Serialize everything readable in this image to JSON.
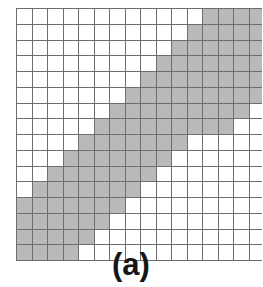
{
  "figure": {
    "caption": "(a)",
    "kind": "binary-grid-diagram"
  },
  "colors": {
    "filled_cell": "#b9b9b9",
    "empty_cell": "#ffffff",
    "grid_line": "#6e6e6e",
    "caption_text": "#161616",
    "background": "#ffffff"
  },
  "chart_data": {
    "type": "heatmap",
    "title": "(a)",
    "xlabel": "",
    "ylabel": "",
    "rows": 16,
    "cols": 16,
    "value_legend": {
      "0": "empty",
      "1": "shaded"
    },
    "cells": [
      [
        0,
        0,
        0,
        0,
        0,
        0,
        0,
        0,
        0,
        0,
        0,
        0,
        1,
        1,
        1,
        1
      ],
      [
        0,
        0,
        0,
        0,
        0,
        0,
        0,
        0,
        0,
        0,
        0,
        1,
        1,
        1,
        1,
        1
      ],
      [
        0,
        0,
        0,
        0,
        0,
        0,
        0,
        0,
        0,
        0,
        1,
        1,
        1,
        1,
        1,
        1
      ],
      [
        0,
        0,
        0,
        0,
        0,
        0,
        0,
        0,
        0,
        1,
        1,
        1,
        1,
        1,
        1,
        1
      ],
      [
        0,
        0,
        0,
        0,
        0,
        0,
        0,
        0,
        1,
        1,
        1,
        1,
        1,
        1,
        1,
        1
      ],
      [
        0,
        0,
        0,
        0,
        0,
        0,
        0,
        1,
        1,
        1,
        1,
        1,
        1,
        1,
        1,
        1
      ],
      [
        0,
        0,
        0,
        0,
        0,
        0,
        1,
        1,
        1,
        1,
        1,
        1,
        1,
        1,
        1,
        0
      ],
      [
        0,
        0,
        0,
        0,
        0,
        1,
        1,
        1,
        1,
        1,
        1,
        1,
        1,
        1,
        0,
        0
      ],
      [
        0,
        0,
        0,
        0,
        1,
        1,
        1,
        1,
        1,
        1,
        1,
        0,
        0,
        0,
        0,
        0
      ],
      [
        0,
        0,
        0,
        1,
        1,
        1,
        1,
        1,
        1,
        1,
        0,
        0,
        0,
        0,
        0,
        0
      ],
      [
        0,
        0,
        1,
        1,
        1,
        1,
        1,
        1,
        1,
        0,
        0,
        0,
        0,
        0,
        0,
        0
      ],
      [
        0,
        1,
        1,
        1,
        1,
        1,
        1,
        1,
        0,
        0,
        0,
        0,
        0,
        0,
        0,
        0
      ],
      [
        1,
        1,
        1,
        1,
        1,
        1,
        1,
        0,
        0,
        0,
        0,
        0,
        0,
        0,
        0,
        0
      ],
      [
        1,
        1,
        1,
        1,
        1,
        1,
        0,
        0,
        0,
        0,
        0,
        0,
        0,
        0,
        0,
        0
      ],
      [
        1,
        1,
        1,
        1,
        1,
        0,
        0,
        0,
        0,
        0,
        0,
        0,
        0,
        0,
        0,
        0
      ],
      [
        1,
        1,
        1,
        1,
        0,
        0,
        0,
        0,
        0,
        0,
        0,
        0,
        0,
        0,
        0,
        0
      ]
    ]
  }
}
